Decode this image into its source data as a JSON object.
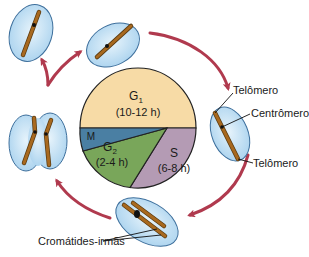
{
  "diagram": {
    "phases": [
      {
        "id": "g1",
        "name": "G",
        "sub": "1",
        "duration": "(10-12 h)",
        "color": "#f7dba6"
      },
      {
        "id": "s",
        "name": "S",
        "sub": "",
        "duration": "(6-8 h)",
        "color": "#b49bb4"
      },
      {
        "id": "g2",
        "name": "G",
        "sub": "2",
        "duration": "(2-4 h)",
        "color": "#79a65a"
      },
      {
        "id": "m",
        "name": "M",
        "sub": "",
        "duration": "",
        "color": "#4a7fa3"
      }
    ],
    "labels": {
      "telomere_top": "Telômero",
      "centromere": "Centrômero",
      "telomere_bottom": "Telômero",
      "sister_chromatids": "Cromátides-irmãs"
    },
    "colors": {
      "arrow": "#b03a4e",
      "cell_fill": "#c6e1f4",
      "cell_stroke": "#3d6f9c",
      "chromosome": "#9c6420",
      "outline": "#222222"
    }
  }
}
